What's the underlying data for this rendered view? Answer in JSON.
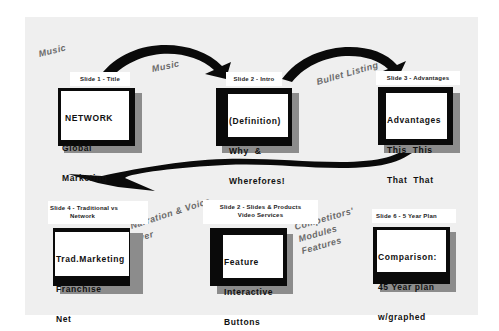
{
  "diagram": {
    "colors": {
      "background_panel": "#efefef",
      "frame": "#0a0a0a",
      "shadow": "#8c8c8c",
      "arrow": "#0a0a0a",
      "annotation": "#6a6a6a"
    },
    "slides": [
      {
        "label": "Slide 1 - Title",
        "lines": [
          "NETWORK",
          "Global",
          "Marketing"
        ]
      },
      {
        "label": "Slide 2 - Intro",
        "lines": [
          "(Definition)",
          "Why  &",
          "Wherefores!"
        ]
      },
      {
        "label": "Slide 3 - Advantages",
        "lines": [
          "Advantages",
          "This  This",
          "That  That"
        ]
      },
      {
        "label": "Slide 4 - Traditional vs Network",
        "label_lines": [
          "Slide 4 - Traditional vs",
          "Network"
        ],
        "lines": [
          "Trad.Marketing",
          "Franchise",
          "Net"
        ]
      },
      {
        "label": "Slide 2 - Slides & Products Video Services",
        "label_lines": [
          "Slide 2 - Slides  &  Products",
          "Video Services"
        ],
        "lines": [
          "Feature",
          "Interactive",
          "Buttons"
        ]
      },
      {
        "label": "Slide 6 - 5 Year Plan",
        "lines": [
          "Comparison:",
          "45 Year plan",
          "w/graphed"
        ]
      }
    ],
    "annotations": [
      {
        "text": "Music",
        "position": "top-left"
      },
      {
        "text": "Music",
        "position": "between slide 1 and slide 2"
      },
      {
        "text": "Bullet Listing",
        "position": "between slide 2 and slide 3"
      },
      {
        "text": "Narration & Voice",
        "position": "between slide 4 and slide 5"
      },
      {
        "text": "over",
        "position": "between slide 4 and slide 5"
      },
      {
        "text": "Competitors'",
        "position": "between slide 5 and slide 6"
      },
      {
        "text": "Modules",
        "position": "between slide 5 and slide 6"
      },
      {
        "text": "Features",
        "position": "between slide 5 and slide 6"
      }
    ],
    "arrows": [
      {
        "from": "Slide 1",
        "to": "Slide 2",
        "icon": "curved-arrow-right"
      },
      {
        "from": "Slide 2",
        "to": "Slide 3",
        "icon": "curved-arrow-right"
      },
      {
        "from": "Slide 3",
        "to": "Slide 4",
        "icon": "wavy-arrow-left"
      }
    ]
  }
}
